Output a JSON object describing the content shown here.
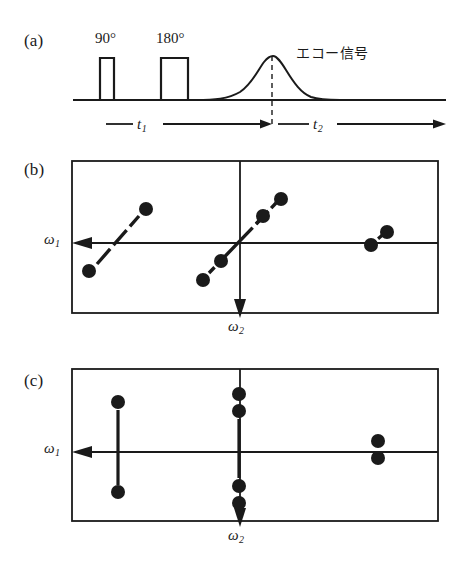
{
  "figure": {
    "type": "nmr-2d-spectroscopy-diagram",
    "panels": [
      {
        "id": "a",
        "label": "(a)",
        "description": "spin-echo pulse sequence timeline"
      },
      {
        "id": "b",
        "label": "(b)",
        "description": "2D spectrum before shearing, tilted multiplets"
      },
      {
        "id": "c",
        "label": "(c)",
        "description": "2D spectrum after shearing, vertical multiplets"
      }
    ]
  },
  "panel_a": {
    "label": "(a)",
    "pulses": [
      {
        "name": "pulse-90",
        "label": "90°",
        "x": 100,
        "width": 14,
        "height": 42
      },
      {
        "name": "pulse-180",
        "label": "180°",
        "x": 161,
        "width": 27,
        "height": 42
      }
    ],
    "echo_label": "エコー信号",
    "intervals": [
      {
        "name": "t1",
        "base": "t",
        "sub": "1"
      },
      {
        "name": "t2",
        "base": "t",
        "sub": "2"
      }
    ],
    "baseline_y": 100,
    "echo_peak_x": 271
  },
  "panel_b": {
    "label": "(b)",
    "axes": {
      "omega1": {
        "base": "ω",
        "sub": "1",
        "direction": "left"
      },
      "omega2": {
        "base": "ω",
        "sub": "2",
        "direction": "down"
      }
    },
    "box": {
      "x": 72,
      "y": 161,
      "width": 366,
      "height": 152
    },
    "origin": {
      "x": 240,
      "y": 243
    },
    "multiplets": [
      {
        "name": "multiplet-left",
        "tilted": true,
        "line": {
          "x1": 97,
          "y1": 264,
          "x2": 139,
          "y2": 217
        },
        "dots": [
          {
            "cx": 146,
            "cy": 209,
            "r": 7
          },
          {
            "cx": 89,
            "cy": 271,
            "r": 7
          }
        ]
      },
      {
        "name": "multiplet-center-lower",
        "tilted": true,
        "line": {
          "x1": 212,
          "y1": 271,
          "x2": 257,
          "y2": 223
        },
        "dots": [
          {
            "cx": 203,
            "cy": 280,
            "r": 7
          },
          {
            "cx": 221,
            "cy": 261,
            "r": 7
          }
        ]
      },
      {
        "name": "multiplet-center-upper",
        "tilted": true,
        "line": {
          "x1": 253,
          "y1": 227,
          "x2": 274,
          "y2": 205
        },
        "dots": [
          {
            "cx": 263,
            "cy": 216,
            "r": 7
          },
          {
            "cx": 281,
            "cy": 199,
            "r": 7
          }
        ]
      },
      {
        "name": "multiplet-right",
        "tilted": true,
        "line": {
          "x1": 372,
          "y1": 243,
          "x2": 387,
          "y2": 231
        },
        "dots": [
          {
            "cx": 371,
            "cy": 245,
            "r": 7
          },
          {
            "cx": 387,
            "cy": 232,
            "r": 7
          }
        ]
      }
    ]
  },
  "panel_c": {
    "label": "(c)",
    "axes": {
      "omega1": {
        "base": "ω",
        "sub": "1",
        "direction": "left"
      },
      "omega2": {
        "base": "ω",
        "sub": "2",
        "direction": "down"
      }
    },
    "box": {
      "x": 72,
      "y": 369,
      "width": 366,
      "height": 152
    },
    "origin": {
      "x": 240,
      "y": 452
    },
    "multiplets": [
      {
        "name": "multiplet-left",
        "tilted": false,
        "line": {
          "x1": 118,
          "y1": 410,
          "x2": 118,
          "y2": 485
        },
        "dots": [
          {
            "cx": 118,
            "cy": 402,
            "r": 7
          },
          {
            "cx": 118,
            "cy": 492,
            "r": 7
          }
        ]
      },
      {
        "name": "multiplet-center",
        "tilted": false,
        "line": {
          "x1": 239,
          "y1": 419,
          "x2": 239,
          "y2": 478
        },
        "dots": [
          {
            "cx": 239,
            "cy": 394,
            "r": 7
          },
          {
            "cx": 239,
            "cy": 411,
            "r": 7
          },
          {
            "cx": 239,
            "cy": 486,
            "r": 7
          },
          {
            "cx": 239,
            "cy": 503,
            "r": 7
          }
        ]
      },
      {
        "name": "multiplet-right",
        "tilted": false,
        "line": null,
        "dots": [
          {
            "cx": 378,
            "cy": 441,
            "r": 7
          },
          {
            "cx": 378,
            "cy": 458,
            "r": 7
          }
        ]
      }
    ]
  },
  "colors": {
    "ink": "#1a1a1a",
    "line": "#222222",
    "background": "#ffffff"
  }
}
